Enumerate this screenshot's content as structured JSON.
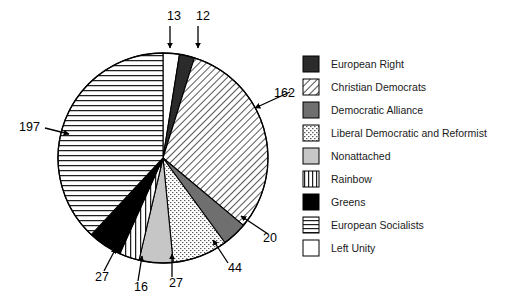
{
  "chart_data": {
    "type": "pie",
    "title": "",
    "subtitle": "",
    "xlabel": "",
    "ylabel": "",
    "total": 518,
    "units": "seats",
    "grid": false,
    "legend_position": "right",
    "start_angle_deg": -90,
    "direction": "clockwise",
    "labels_shown_as": "value-callouts-with-arrows",
    "categories": [
      "European Right",
      "Christian Democrats",
      "Democratic Alliance",
      "Liberal Democratic and Reformist",
      "Nonattached",
      "Rainbow",
      "Greens",
      "European Socialists",
      "Left Unity"
    ],
    "values": [
      12,
      162,
      20,
      44,
      27,
      16,
      27,
      197,
      13
    ],
    "slices": [
      {
        "label": "European Right",
        "value": 12,
        "pattern": "solid-very-dark",
        "fill": "#2b2b2b",
        "callout": "12",
        "callout_x": 196,
        "callout_y": 20,
        "arrow_from_x": 198,
        "arrow_from_y": 26,
        "arrow_to_x": 198,
        "arrow_to_y": 48
      },
      {
        "label": "Christian Democrats",
        "value": 162,
        "pattern": "diagonal-hatch",
        "fill": "#ffffff",
        "callout": "162",
        "callout_x": 274,
        "callout_y": 97,
        "arrow_from_x": 290,
        "arrow_from_y": 92,
        "arrow_to_x": 255,
        "arrow_to_y": 108
      },
      {
        "label": "Democratic Alliance",
        "value": 20,
        "pattern": "solid-mid-gray",
        "fill": "#6f6f6f",
        "callout": "20",
        "callout_x": 263,
        "callout_y": 242,
        "arrow_from_x": 268,
        "arrow_from_y": 234,
        "arrow_to_x": 241,
        "arrow_to_y": 216
      },
      {
        "label": "Liberal Democratic and Reformist",
        "value": 44,
        "pattern": "dotted-stipple",
        "fill": "#ffffff",
        "callout": "44",
        "callout_x": 228,
        "callout_y": 272,
        "arrow_from_x": 228,
        "arrow_from_y": 263,
        "arrow_to_x": 213,
        "arrow_to_y": 240
      },
      {
        "label": "Nonattached",
        "value": 27,
        "pattern": "solid-light-gray",
        "fill": "#c6c6c6",
        "callout": "27",
        "callout_x": 169,
        "callout_y": 287,
        "arrow_from_x": 172,
        "arrow_from_y": 277,
        "arrow_to_x": 172,
        "arrow_to_y": 254
      },
      {
        "label": "Rainbow",
        "value": 16,
        "pattern": "vertical-lines",
        "fill": "#ffffff",
        "callout": "16",
        "callout_x": 134,
        "callout_y": 291,
        "arrow_from_x": 138,
        "arrow_from_y": 281,
        "arrow_to_x": 142,
        "arrow_to_y": 256
      },
      {
        "label": "Greens",
        "value": 27,
        "pattern": "solid-black",
        "fill": "#000000",
        "callout": "27",
        "callout_x": 95,
        "callout_y": 281,
        "arrow_from_x": 104,
        "arrow_from_y": 271,
        "arrow_to_x": 116,
        "arrow_to_y": 248
      },
      {
        "label": "European Socialists",
        "value": 197,
        "pattern": "horizontal-lines",
        "fill": "#ffffff",
        "callout": "197",
        "callout_x": 19,
        "callout_y": 131,
        "arrow_from_x": 45,
        "arrow_from_y": 128,
        "arrow_to_x": 69,
        "arrow_to_y": 134
      },
      {
        "label": "Left Unity",
        "value": 13,
        "pattern": "empty-white",
        "fill": "#ffffff",
        "callout": "13",
        "callout_x": 167,
        "callout_y": 20,
        "arrow_from_x": 170,
        "arrow_from_y": 26,
        "arrow_to_x": 170,
        "arrow_to_y": 48
      }
    ]
  },
  "legend": {
    "items": [
      {
        "label": "European Right",
        "pattern": "solid-very-dark"
      },
      {
        "label": "Christian Democrats",
        "pattern": "diagonal-hatch"
      },
      {
        "label": "Democratic Alliance",
        "pattern": "solid-mid-gray"
      },
      {
        "label": "Liberal Democratic and Reformist",
        "pattern": "dotted-stipple"
      },
      {
        "label": "Nonattached",
        "pattern": "solid-light-gray"
      },
      {
        "label": "Rainbow",
        "pattern": "vertical-lines"
      },
      {
        "label": "Greens",
        "pattern": "solid-black"
      },
      {
        "label": "European Socialists",
        "pattern": "horizontal-lines"
      },
      {
        "label": "Left Unity",
        "pattern": "empty-white"
      }
    ]
  },
  "geometry": {
    "center_x": 163,
    "center_y": 158,
    "radius": 105,
    "legend_x": 303,
    "legend_y": 56,
    "legend_swatch_size": 16,
    "legend_row_height": 23,
    "legend_text_offset_x": 28
  },
  "colors": {
    "stroke": "#000000",
    "background": "#ffffff",
    "very_dark": "#2b2b2b",
    "mid_gray": "#6f6f6f",
    "light_gray": "#c6c6c6",
    "black": "#000000",
    "white": "#ffffff"
  }
}
